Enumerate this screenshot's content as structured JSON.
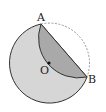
{
  "diagram": {
    "points": {
      "A": {
        "label": "A",
        "x": 41,
        "y": 24
      },
      "B": {
        "label": "B",
        "x": 87,
        "y": 77
      },
      "O": {
        "label": "O",
        "x": 48,
        "y": 64
      }
    },
    "circle_radius": 40,
    "colors": {
      "disk_fill": "#d6d6d6",
      "folded_fill": "#a9a9a9",
      "stroke": "#333333",
      "dashed_arc": "#999999"
    }
  }
}
